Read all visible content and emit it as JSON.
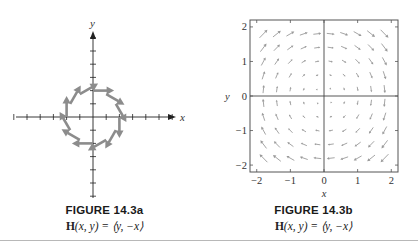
{
  "figures": [
    {
      "id": "14.3a",
      "caption": "FIGURE 14.3a",
      "formula_prefix": "H",
      "formula_rest": "(x, y) = ⟨y, −x⟩"
    },
    {
      "id": "14.3b",
      "caption": "FIGURE 14.3b",
      "formula_prefix": "H",
      "formula_rest": "(x, y) = ⟨y, −x⟩"
    }
  ],
  "colors": {
    "arrow_a": "#8c8c8c",
    "arrow_b": "#9a9a9a",
    "axis": "#222222",
    "frame": "#555555",
    "rule": "#b8b8b8"
  },
  "chart_data": [
    {
      "type": "vector_field",
      "title": "FIGURE 14.3a",
      "subtitle": "H(x, y) = ⟨y, −x⟩",
      "xlabel": "x",
      "ylabel": "y",
      "grid": false,
      "axes_style": "cross axes with tick marks, no tick labels",
      "ticks": [
        -6,
        -5,
        -4,
        -3,
        -2,
        -1,
        1,
        2,
        3,
        4,
        5,
        6
      ],
      "xlim": [
        -6,
        6.5
      ],
      "ylim": [
        -6.5,
        6.5
      ],
      "field": "H(x,y) = (y, -x)",
      "sample_points": "12 points on circle of radius 2 at 30° intervals",
      "points": [
        {
          "x": 2.0,
          "y": 0.0,
          "u": 0.0,
          "v": -2.0
        },
        {
          "x": 1.73,
          "y": 1.0,
          "u": 1.0,
          "v": -1.73
        },
        {
          "x": 1.0,
          "y": 1.73,
          "u": 1.73,
          "v": -1.0
        },
        {
          "x": 0.0,
          "y": 2.0,
          "u": 2.0,
          "v": 0.0
        },
        {
          "x": -1.0,
          "y": 1.73,
          "u": 1.73,
          "v": 1.0
        },
        {
          "x": -1.73,
          "y": 1.0,
          "u": 1.0,
          "v": 1.73
        },
        {
          "x": -2.0,
          "y": 0.0,
          "u": 0.0,
          "v": 2.0
        },
        {
          "x": -1.73,
          "y": -1.0,
          "u": -1.0,
          "v": 1.73
        },
        {
          "x": -1.0,
          "y": -1.73,
          "u": -1.73,
          "v": 1.0
        },
        {
          "x": 0.0,
          "y": -2.0,
          "u": -2.0,
          "v": 0.0
        },
        {
          "x": 1.0,
          "y": -1.73,
          "u": -1.73,
          "v": -1.0
        },
        {
          "x": 1.73,
          "y": -1.0,
          "u": -1.0,
          "v": -1.73
        }
      ],
      "arrow_scale": 0.8
    },
    {
      "type": "vector_field",
      "title": "FIGURE 14.3b",
      "subtitle": "H(x, y) = ⟨y, −x⟩",
      "xlabel": "x",
      "ylabel": "y",
      "grid": false,
      "frame": true,
      "xlim": [
        -2.2,
        2.2
      ],
      "ylim": [
        -2.2,
        2.2
      ],
      "xticks": [
        -2,
        -1,
        0,
        1,
        2
      ],
      "xtick_labels": [
        "−2",
        "−1",
        "0",
        "1",
        "2"
      ],
      "yticks": [
        2,
        1,
        0,
        -1,
        -2
      ],
      "ytick_labels": [
        "2",
        "1",
        "0",
        "−1",
        "−2"
      ],
      "field": "H(x,y) = (y, -x)",
      "grid_points": {
        "start": -1.8,
        "step": 0.4,
        "count": 10
      },
      "arrow_scale": 0.13
    }
  ]
}
